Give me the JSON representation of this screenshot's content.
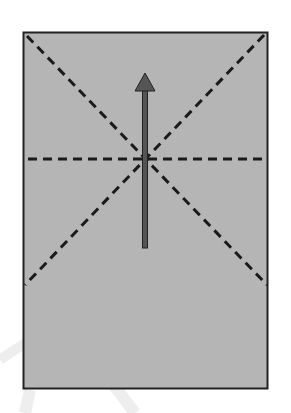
{
  "diagram": {
    "sheet": {
      "x": 23,
      "y": 32,
      "width": 245,
      "height": 357,
      "fill": "#b5b5b5",
      "stroke": "#222222"
    },
    "fold_lines": [
      {
        "name": "diagonal-tl-br",
        "x1": 27,
        "y1": 36,
        "x2": 267,
        "y2": 285
      },
      {
        "name": "diagonal-tr-bl",
        "x1": 264,
        "y1": 35,
        "x2": 25,
        "y2": 285
      },
      {
        "name": "horizontal",
        "x1": 28,
        "y1": 159,
        "x2": 267,
        "y2": 159
      }
    ],
    "arrow": {
      "x": 145,
      "tail_y": 247,
      "tip_y": 73,
      "color": "#555555",
      "direction": "up"
    },
    "colors": {
      "dash": "#1a1a1a",
      "watermark": "#eeeeee"
    }
  }
}
